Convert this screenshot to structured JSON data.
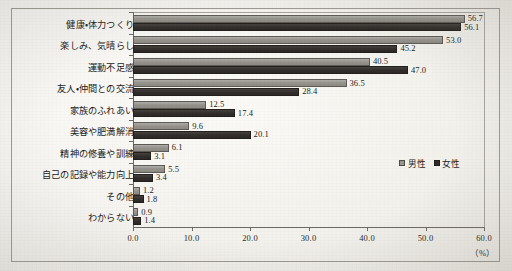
{
  "chart_data": {
    "type": "bar",
    "orientation": "horizontal",
    "title": "",
    "xlabel": "(%)",
    "ylabel": "",
    "xlim": [
      0.0,
      60.0
    ],
    "xticks": [
      "0.0",
      "10.0",
      "20.0",
      "30.0",
      "40.0",
      "50.0",
      "60.0"
    ],
    "xtick_values": [
      0,
      10,
      20,
      30,
      40,
      50,
      60
    ],
    "grid": false,
    "legend_position": "right-middle",
    "categories": [
      "健康・体力つくり",
      "楽しみ、気晴らし",
      "運動不足感",
      "友人・仲間との交流",
      "家族のふれあい",
      "美容や肥満解消",
      "精神の修養や訓練",
      "自己の記録や能力向上",
      "その他",
      "わからない"
    ],
    "series": [
      {
        "name": "男性",
        "color": "#97948e",
        "values": [
          56.7,
          53.0,
          40.5,
          36.5,
          12.5,
          9.6,
          6.1,
          5.5,
          1.2,
          0.9
        ],
        "labels": [
          "56.7",
          "53.0",
          "40.5",
          "36.5",
          "12.5",
          "9.6",
          "6.1",
          "5.5",
          "1.2",
          "0.9"
        ]
      },
      {
        "name": "女性",
        "color": "#2f2c29",
        "values": [
          56.1,
          45.2,
          47.0,
          28.4,
          17.4,
          20.1,
          3.1,
          3.4,
          1.8,
          1.4
        ],
        "labels": [
          "56.1",
          "45.2",
          "47.0",
          "28.4",
          "17.4",
          "20.1",
          "3.1",
          "3.4",
          "1.8",
          "1.4"
        ]
      }
    ]
  },
  "legend": {
    "items": [
      {
        "label": "男性",
        "swatch": "male"
      },
      {
        "label": "女性",
        "swatch": "female"
      }
    ]
  },
  "axis": {
    "unit": "（%）"
  }
}
